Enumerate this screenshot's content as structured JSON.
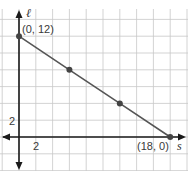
{
  "chart_data": {
    "type": "line",
    "title": "",
    "xlabel": "s",
    "ylabel": "ℓ",
    "xlim": [
      -2,
      20
    ],
    "ylim": [
      -4,
      14
    ],
    "grid": true,
    "grid_step": 2,
    "x_tick_labels": [
      "2"
    ],
    "y_tick_labels": [
      "2"
    ],
    "series": [
      {
        "name": "line",
        "x": [
          0,
          6,
          12,
          18
        ],
        "y": [
          12,
          8,
          4,
          0
        ]
      }
    ],
    "annotations": [
      {
        "text": "(0, 12)",
        "x": 0,
        "y": 12
      },
      {
        "text": "(18, 0)",
        "x": 18,
        "y": 0
      }
    ],
    "colors": {
      "line": "#555555",
      "point": "#444444",
      "axis": "#1a1a1a",
      "grid": "#c8c8c8"
    }
  },
  "labels": {
    "x_axis": "s",
    "y_axis": "ℓ",
    "x_tick": "2",
    "y_tick": "2",
    "point_start": "(0, 12)",
    "point_end": "(18, 0)"
  }
}
